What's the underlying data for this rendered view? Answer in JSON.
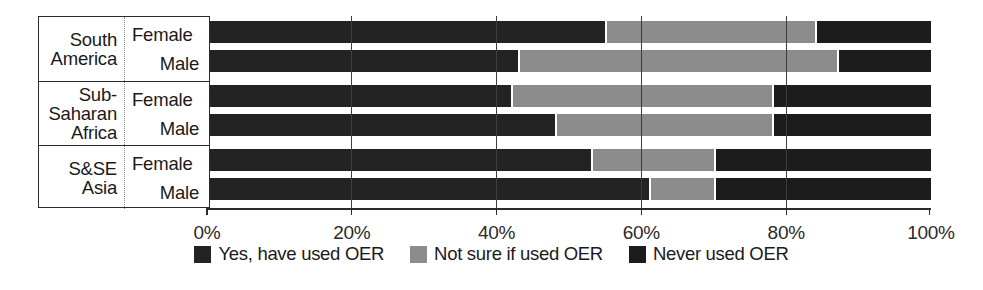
{
  "chart_data": {
    "type": "bar",
    "orientation": "horizontal",
    "stacked": true,
    "stacked_percent": true,
    "title": "",
    "xlabel": "",
    "ylabel": "",
    "xlim": [
      0,
      100
    ],
    "grid": true,
    "legend_position": "bottom",
    "xticks": [
      {
        "value": 0,
        "label": "0%"
      },
      {
        "value": 20,
        "label": "20%"
      },
      {
        "value": 40,
        "label": "40%"
      },
      {
        "value": 60,
        "label": "60%"
      },
      {
        "value": 80,
        "label": "80%"
      },
      {
        "value": 100,
        "label": "100%"
      }
    ],
    "group_header": "",
    "groups": [
      {
        "region": "South America",
        "region_lines": [
          "South",
          "America"
        ]
      },
      {
        "region": "Sub-Saharan Africa",
        "region_lines": [
          "Sub-",
          "Saharan",
          "Africa"
        ]
      },
      {
        "region": "S&SE Asia",
        "region_lines": [
          "S&SE",
          "Asia"
        ]
      }
    ],
    "categories": [
      "South America - Female",
      "South America - Male",
      "Sub-Saharan Africa - Female",
      "Sub-Saharan Africa - Male",
      "S&SE Asia - Female",
      "S&SE Asia - Male"
    ],
    "gender_labels": [
      "Female",
      "Male"
    ],
    "series": [
      {
        "name": "Yes, have used OER",
        "color": "#232323",
        "values": [
          55,
          43,
          42,
          48,
          53,
          61
        ]
      },
      {
        "name": "Not sure if used OER",
        "color": "#8c8c8c",
        "values": [
          29,
          44,
          36,
          30,
          17,
          9
        ]
      },
      {
        "name": "Never used OER",
        "color": "#1c1c1c",
        "values": [
          16,
          13,
          22,
          22,
          30,
          30
        ]
      }
    ],
    "rows": [
      {
        "region": "South America",
        "gender": "Female",
        "yes": 55,
        "not_sure": 29,
        "never": 16
      },
      {
        "region": "South America",
        "gender": "Male",
        "yes": 43,
        "not_sure": 44,
        "never": 13
      },
      {
        "region": "Sub-Saharan Africa",
        "gender": "Female",
        "yes": 42,
        "not_sure": 36,
        "never": 22
      },
      {
        "region": "Sub-Saharan Africa",
        "gender": "Male",
        "yes": 48,
        "not_sure": 30,
        "never": 22
      },
      {
        "region": "S&SE Asia",
        "gender": "Female",
        "yes": 53,
        "not_sure": 17,
        "never": 30
      },
      {
        "region": "S&SE Asia",
        "gender": "Male",
        "yes": 61,
        "not_sure": 9,
        "never": 30
      }
    ],
    "legend": [
      {
        "label": "Yes, have used OER",
        "color": "#232323"
      },
      {
        "label": "Not sure if used OER",
        "color": "#8c8c8c"
      },
      {
        "label": "Never used OER",
        "color": "#1c1c1c"
      }
    ]
  }
}
